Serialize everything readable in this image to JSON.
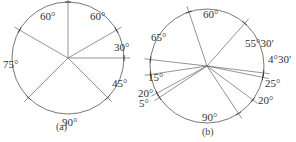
{
  "figures": [
    {
      "caption": "(a)",
      "center": [
        68,
        58
      ],
      "radius": 56,
      "line_angles_deg": [
        90,
        30,
        0,
        -45,
        -135,
        150
      ],
      "arc_labels": [
        {
          "text": "60°",
          "x": 40,
          "y": 20
        },
        {
          "text": "60°",
          "x": 90,
          "y": 20
        },
        {
          "text": "30°",
          "x": 114,
          "y": 51
        },
        {
          "text": "45°",
          "x": 112,
          "y": 87
        },
        {
          "text": "90°",
          "x": 62,
          "y": 126
        },
        {
          "text": "75°",
          "x": 3,
          "y": 68
        }
      ],
      "caption_pos": [
        56,
        130
      ]
    },
    {
      "caption": "(b)",
      "center": [
        207,
        66
      ],
      "radius": 57,
      "line_angles_deg": [
        108.5,
        48.5,
        -7,
        -11.5,
        -36.5,
        -56.5,
        -146.5,
        -151.5,
        -171.5,
        173.5
      ],
      "arc_labels": [
        {
          "text": "60°",
          "x": 203,
          "y": 18
        },
        {
          "text": "65°",
          "x": 151,
          "y": 41
        },
        {
          "text": "55°30′",
          "x": 245,
          "y": 47
        },
        {
          "text": "4°30′",
          "x": 268,
          "y": 63
        },
        {
          "text": "15°",
          "x": 148,
          "y": 81
        },
        {
          "text": "25°",
          "x": 265,
          "y": 87
        },
        {
          "text": "20°",
          "x": 138,
          "y": 97
        },
        {
          "text": "20°",
          "x": 258,
          "y": 104
        },
        {
          "text": "5°",
          "x": 139,
          "y": 107
        },
        {
          "text": "90°",
          "x": 202,
          "y": 121
        }
      ],
      "caption_pos": [
        202,
        135
      ]
    }
  ]
}
